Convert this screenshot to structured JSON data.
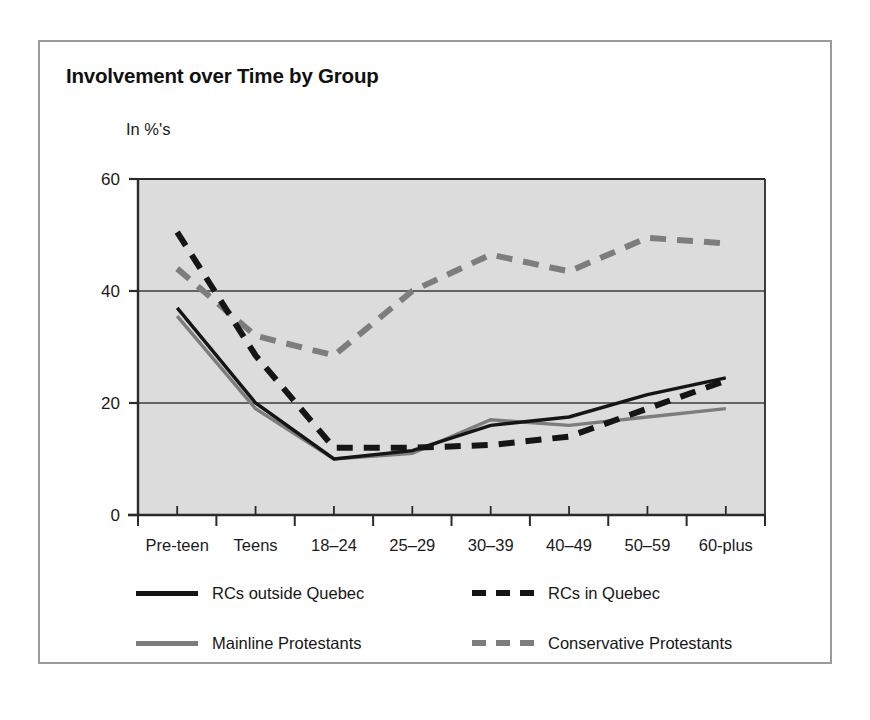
{
  "figure": {
    "title": "Involvement over Time by Group",
    "y_unit_caption": "In %'s"
  },
  "chart_data": {
    "type": "line",
    "title": "Involvement over Time by Group",
    "xlabel": "",
    "ylabel": "In %'s",
    "ylim": [
      0,
      60
    ],
    "yticks": [
      0,
      20,
      40,
      60
    ],
    "grid": "horizontal-at-20-and-40",
    "legend_position": "below-plot",
    "plot_background": "#dcdcdc",
    "categories": [
      "Pre-teen",
      "Teens",
      "18–24",
      "25–29",
      "30–39",
      "40–49",
      "50–59",
      "60-plus"
    ],
    "series": [
      {
        "name": "RCs outside Quebec",
        "style": "solid",
        "color": "#151515",
        "values": [
          37,
          20,
          10,
          11.5,
          16,
          17.5,
          21.5,
          24.5
        ]
      },
      {
        "name": "RCs in Quebec",
        "style": "dashed",
        "color": "#151515",
        "values": [
          50.5,
          28.5,
          12,
          12,
          12.5,
          14,
          19,
          24
        ]
      },
      {
        "name": "Mainline Protestants",
        "style": "solid",
        "color": "#7d7d7d",
        "values": [
          35.5,
          19,
          10,
          11,
          17,
          16,
          17.5,
          19
        ]
      },
      {
        "name": "Conservative Protestants",
        "style": "dashed",
        "color": "#7d7d7d",
        "values": [
          44,
          32,
          28.5,
          40,
          46.5,
          43.5,
          49.5,
          48.5
        ]
      }
    ]
  },
  "legend": {
    "items": [
      {
        "label": "RCs outside Quebec",
        "swatch": "solid-black"
      },
      {
        "label": "RCs in Quebec",
        "swatch": "dashed-black"
      },
      {
        "label": "Mainline Protestants",
        "swatch": "solid-gray"
      },
      {
        "label": "Conservative Protestants",
        "swatch": "dashed-gray"
      }
    ]
  }
}
